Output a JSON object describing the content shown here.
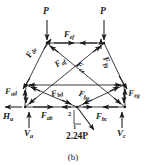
{
  "figure": {
    "caption": "(b)",
    "type": "truss-free-body-diagram",
    "ink_color": "#1a1a1a",
    "background": "#ffffff"
  },
  "loads": {
    "top_left_load": "P",
    "top_right_load": "P",
    "applied_force": "2.24P",
    "applied_force_slope_rise": "2",
    "applied_force_slope_run": "1"
  },
  "reactions": {
    "horizontal_a": {
      "base": "H",
      "sub": "a"
    },
    "vertical_a": {
      "base": "V",
      "sub": "a"
    },
    "vertical_c": {
      "base": "V",
      "sub": "c"
    }
  },
  "members": [
    {
      "id": "de",
      "base": "F",
      "sub": "de"
    },
    {
      "id": "ef",
      "base": "F",
      "sub": "ef"
    },
    {
      "id": "fg",
      "base": "F",
      "sub": "fg"
    },
    {
      "id": "af",
      "base": "F",
      "sub": "af"
    },
    {
      "id": "ce",
      "base": "F",
      "sub": "ce"
    },
    {
      "id": "ad",
      "base": "F",
      "sub": "ad"
    },
    {
      "id": "bd",
      "base": "F",
      "sub": "bd"
    },
    {
      "id": "bg",
      "base": "F",
      "sub": "bg"
    },
    {
      "id": "eg",
      "base": "F",
      "sub": "eg"
    },
    {
      "id": "ab",
      "base": "F",
      "sub": "ab"
    },
    {
      "id": "bc",
      "base": "F",
      "sub": "bc"
    }
  ]
}
